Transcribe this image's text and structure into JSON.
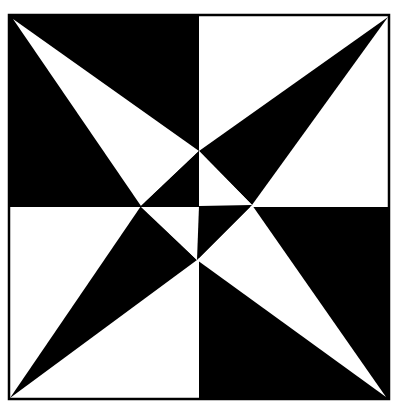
{
  "figure": {
    "colors": {
      "ink": "#000000",
      "paper": "#ffffff"
    }
  }
}
